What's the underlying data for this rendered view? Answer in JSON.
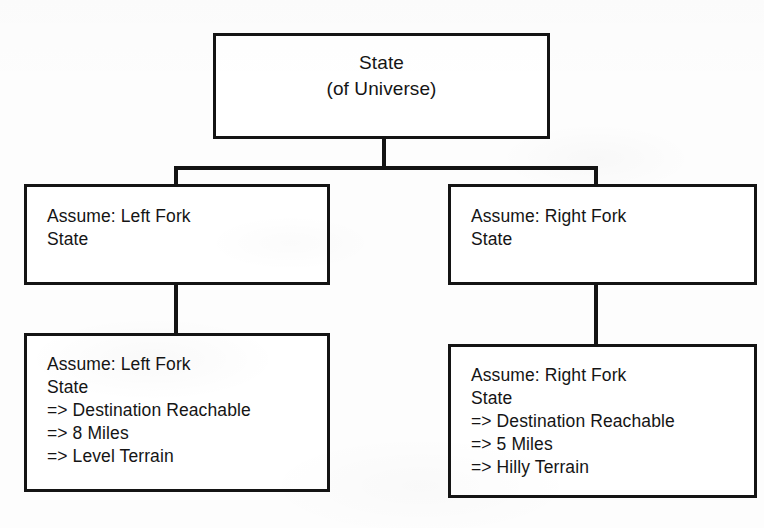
{
  "diagram": {
    "ink_color": "#141414",
    "paper_color": "#fdfdfd",
    "nodes": {
      "root": {
        "id": "root",
        "lines": [
          "State",
          "(of Universe)"
        ]
      },
      "left_assume": {
        "id": "left-assume",
        "lines": [
          "Assume: Left Fork",
          "State"
        ]
      },
      "right_assume": {
        "id": "right-assume",
        "lines": [
          "Assume: Right Fork",
          "State"
        ]
      },
      "left_result": {
        "id": "left-result",
        "lines": [
          "Assume: Left Fork",
          "State",
          "=> Destination Reachable",
          "=> 8 Miles",
          "=> Level Terrain"
        ]
      },
      "right_result": {
        "id": "right-result",
        "lines": [
          "Assume: Right Fork",
          "State",
          "=> Destination Reachable",
          "=> 5 Miles",
          "=> Hilly Terrain"
        ]
      }
    },
    "edges": [
      {
        "id": "root-to-bus",
        "from": "root",
        "to": "fork-bus"
      },
      {
        "id": "bus-to-left-assume",
        "from": "fork-bus",
        "to": "left-assume"
      },
      {
        "id": "bus-to-right-assume",
        "from": "fork-bus",
        "to": "right-assume"
      },
      {
        "id": "left-assume-to-left-result",
        "from": "left-assume",
        "to": "left-result"
      },
      {
        "id": "right-assume-to-right-result",
        "from": "right-assume",
        "to": "right-result"
      }
    ]
  }
}
